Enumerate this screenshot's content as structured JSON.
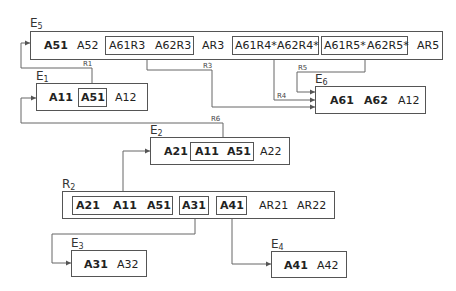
{
  "entities": {
    "E5": {
      "label": "E",
      "sub": "5",
      "attrs": [
        {
          "text": "A51",
          "bold": true
        },
        {
          "text": "A52",
          "bold": false
        },
        {
          "text": "A61R3",
          "bold": false
        },
        {
          "text": "A62R3",
          "bold": false
        },
        {
          "text": "AR3",
          "bold": false
        },
        {
          "text": "A61R4*",
          "bold": false
        },
        {
          "text": "A62R4*",
          "bold": false
        },
        {
          "text": "A61R5*",
          "bold": false
        },
        {
          "text": "A62R5*",
          "bold": false
        },
        {
          "text": "AR5",
          "bold": false
        }
      ]
    },
    "E1": {
      "label": "E",
      "sub": "1",
      "attrs": [
        {
          "text": "A11",
          "bold": true
        },
        {
          "text": "A51",
          "bold": true
        },
        {
          "text": "A12",
          "bold": false
        }
      ]
    },
    "E6": {
      "label": "E",
      "sub": "6",
      "attrs": [
        {
          "text": "A61",
          "bold": true
        },
        {
          "text": "A62",
          "bold": true
        },
        {
          "text": "A12",
          "bold": false
        }
      ]
    },
    "E2": {
      "label": "E",
      "sub": "2",
      "attrs": [
        {
          "text": "A21",
          "bold": true
        },
        {
          "text": "A11",
          "bold": true
        },
        {
          "text": "A51",
          "bold": true
        },
        {
          "text": "A22",
          "bold": false
        }
      ]
    },
    "R2": {
      "label": "R",
      "sub": "2",
      "attrs": [
        {
          "text": "A21",
          "bold": true
        },
        {
          "text": "A11",
          "bold": true
        },
        {
          "text": "A51",
          "bold": true
        },
        {
          "text": "A31",
          "bold": true
        },
        {
          "text": "A41",
          "bold": true
        },
        {
          "text": "AR21",
          "bold": false
        },
        {
          "text": "AR22",
          "bold": false
        }
      ]
    },
    "E3": {
      "label": "E",
      "sub": "3",
      "attrs": [
        {
          "text": "A31",
          "bold": true
        },
        {
          "text": "A32",
          "bold": false
        }
      ]
    },
    "E4": {
      "label": "E",
      "sub": "4",
      "attrs": [
        {
          "text": "A41",
          "bold": true
        },
        {
          "text": "A42",
          "bold": false
        }
      ]
    }
  },
  "relationships": [
    "R1",
    "R3",
    "R4",
    "R5",
    "R6"
  ],
  "colors": {
    "line": "#555555",
    "text": "#222222",
    "background": "#ffffff"
  }
}
